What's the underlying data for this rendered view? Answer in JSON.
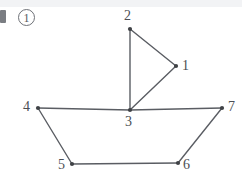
{
  "page": {
    "background_color": "#ffffff",
    "top_band_color": "#f2f3f5",
    "marker_label": "1",
    "corner_block_name": "dark-block"
  },
  "diagram": {
    "stroke_color": "#5a5d63",
    "node_color": "#3f4246",
    "label_color": "#4b4e53",
    "nodes": [
      {
        "id": "1",
        "label": "1",
        "x": 176,
        "y": 66,
        "label_x": 182,
        "label_y": 59
      },
      {
        "id": "2",
        "label": "2",
        "x": 130,
        "y": 29,
        "label_x": 124,
        "label_y": 9
      },
      {
        "id": "3",
        "label": "3",
        "x": 130,
        "y": 110,
        "label_x": 125,
        "label_y": 115
      },
      {
        "id": "4",
        "label": "4",
        "x": 38,
        "y": 108,
        "label_x": 23,
        "label_y": 100
      },
      {
        "id": "5",
        "label": "5",
        "x": 72,
        "y": 164,
        "label_x": 58,
        "label_y": 158
      },
      {
        "id": "6",
        "label": "6",
        "x": 178,
        "y": 163,
        "label_x": 183,
        "label_y": 158
      },
      {
        "id": "7",
        "label": "7",
        "x": 222,
        "y": 108,
        "label_x": 228,
        "label_y": 100
      }
    ],
    "edges": [
      {
        "from": "2",
        "to": "1"
      },
      {
        "from": "2",
        "to": "3"
      },
      {
        "from": "1",
        "to": "3"
      },
      {
        "from": "4",
        "to": "3"
      },
      {
        "from": "3",
        "to": "7"
      },
      {
        "from": "4",
        "to": "5"
      },
      {
        "from": "5",
        "to": "6"
      },
      {
        "from": "6",
        "to": "7"
      }
    ]
  }
}
